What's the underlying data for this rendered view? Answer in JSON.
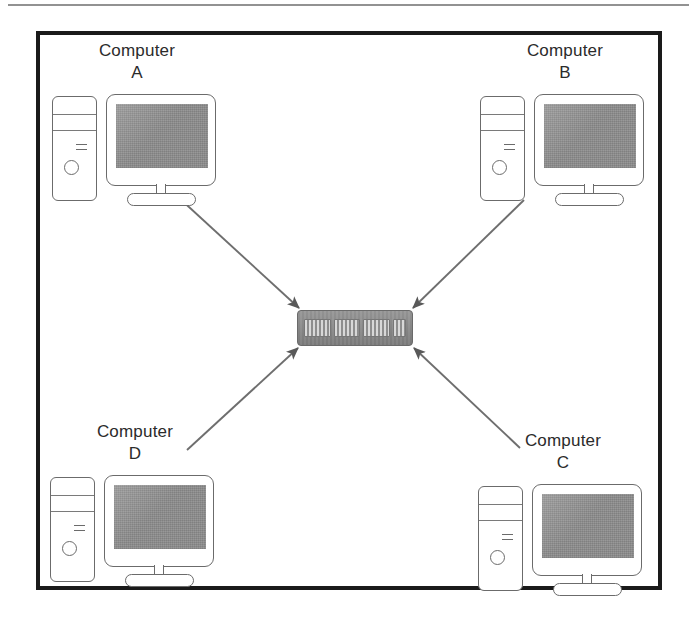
{
  "diagram": {
    "background_color": "#ffffff",
    "frame_color": "#1a1a1a",
    "device_gray": "#8d8d8d",
    "line_color": "#6b6b6b",
    "nodes": [
      {
        "id": "A",
        "label": "Computer\nA",
        "name": "Computer A",
        "position": "top-left"
      },
      {
        "id": "B",
        "label": "Computer\nB",
        "name": "Computer B",
        "position": "top-right"
      },
      {
        "id": "C",
        "label": "Computer\nC",
        "name": "Computer C",
        "position": "bottom-right"
      },
      {
        "id": "D",
        "label": "Computer\nD",
        "name": "Computer D",
        "position": "bottom-left"
      }
    ],
    "central_device": {
      "type": "network-switch",
      "port_blocks": 4,
      "port_block_widths": [
        "wide",
        "wide",
        "wide",
        "narrow"
      ]
    },
    "connections": [
      {
        "from": "A",
        "to": "switch",
        "arrowhead": "filled-triangle",
        "direction": "to-switch"
      },
      {
        "from": "B",
        "to": "switch",
        "arrowhead": "filled-triangle",
        "direction": "to-switch"
      },
      {
        "from": "C",
        "to": "switch",
        "arrowhead": "filled-triangle",
        "direction": "to-switch"
      },
      {
        "from": "D",
        "to": "switch",
        "arrowhead": "filled-triangle",
        "direction": "to-switch"
      }
    ]
  }
}
